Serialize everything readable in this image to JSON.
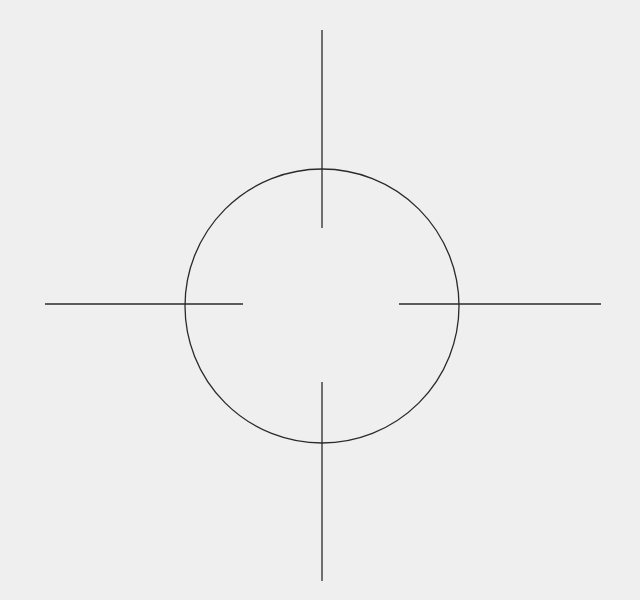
{
  "diagram": {
    "description": "Crosshair / reticle: circle with four radial line segments",
    "background": "#efefef",
    "stroke_color": "#2a2a2a",
    "stroke_width": 1.3,
    "circle": {
      "cx": 322,
      "cy": 306,
      "r": 137
    },
    "lines": [
      {
        "name": "top",
        "x1": 322,
        "y1": 30,
        "x2": 322,
        "y2": 228
      },
      {
        "name": "bottom",
        "x1": 322,
        "y1": 382,
        "x2": 322,
        "y2": 581
      },
      {
        "name": "left",
        "x1": 45,
        "y1": 304,
        "x2": 243,
        "y2": 304
      },
      {
        "name": "right",
        "x1": 399,
        "y1": 304,
        "x2": 601,
        "y2": 304
      }
    ]
  }
}
